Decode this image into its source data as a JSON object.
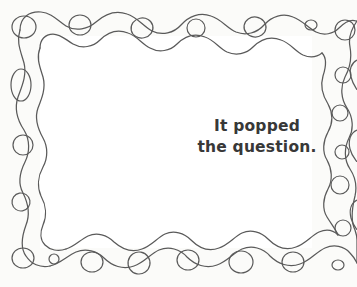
{
  "page": {
    "width": 357,
    "height": 287,
    "background_color": "#fbfbf9",
    "inner_color": "#ffffff",
    "title": "It popped the question."
  },
  "caption": {
    "line1": "It popped",
    "line2": "the question.",
    "full_text": "It popped the question.",
    "color": "#383838",
    "align": "center"
  },
  "frame": {
    "style_name": "wavy-beaded-border",
    "stroke_color": "#5a5a5a",
    "stroke_width": 1.25,
    "description": "hand-drawn double wavy line frame with oval beads",
    "bead_counts": {
      "top": 7,
      "bottom": 8,
      "left": 4,
      "right": 6
    }
  }
}
